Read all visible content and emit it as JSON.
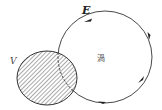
{
  "diagram": {
    "labels": {
      "field": "E",
      "region": "V",
      "vortex": "渦"
    },
    "shapes": {
      "region_circle": {
        "cx": 47,
        "cy": 78,
        "rx": 30,
        "ry": 27,
        "fill": "hatched"
      },
      "field_loop": {
        "cx": 105,
        "cy": 57,
        "rx": 47,
        "ry": 46,
        "dashed_inside_region": true
      },
      "arrows": [
        {
          "position": "top",
          "direction": "left"
        },
        {
          "position": "right",
          "direction": "up"
        },
        {
          "position": "lower-right",
          "direction": "up-right"
        },
        {
          "position": "bottom",
          "direction": "right"
        }
      ]
    },
    "colors": {
      "stroke": "#333333",
      "hatch": "#555555",
      "background": "#ffffff"
    }
  }
}
